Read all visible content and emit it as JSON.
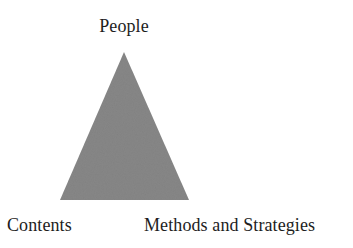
{
  "figure": {
    "type": "triangle-diagram",
    "background_color": "#ffffff",
    "width": 353,
    "height": 248
  },
  "shape": {
    "name": "filled-triangle",
    "fill_color": "#878787",
    "apex": {
      "x": 124,
      "y": 52
    },
    "bottom_left": {
      "x": 60,
      "y": 200
    },
    "bottom_right": {
      "x": 189,
      "y": 200
    }
  },
  "labels": {
    "apex": "People",
    "bottom_left": "Contents",
    "bottom_right": "Methods and Strategies",
    "text_color": "#1d1d1d"
  }
}
